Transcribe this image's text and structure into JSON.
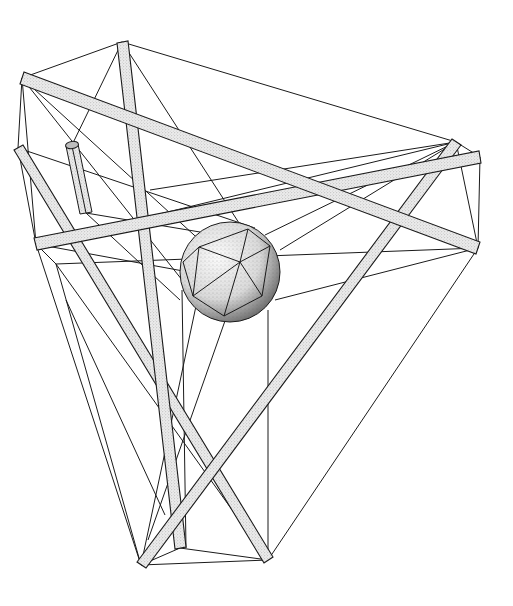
{
  "figure": {
    "title": "Tensegrity structure with suspended sphere",
    "colors": {
      "background": "#ffffff",
      "line": "#1a1a1a",
      "stipple_fill": "#d8d8d8"
    },
    "nodes": {
      "A": [
        122,
        42
      ],
      "B": [
        22,
        78
      ],
      "C": [
        18,
        148
      ],
      "D": [
        36,
        244
      ],
      "E": [
        456,
        142
      ],
      "F": [
        480,
        157
      ],
      "G": [
        478,
        248
      ],
      "H": [
        141,
        565
      ],
      "I": [
        180,
        548
      ],
      "J": [
        268,
        560
      ]
    },
    "struts": [
      {
        "name": "strut-a-i",
        "from": [
          122,
          42
        ],
        "to": [
          180,
          548
        ],
        "width": 11
      },
      {
        "name": "strut-b-g",
        "from": [
          22,
          78
        ],
        "to": [
          478,
          248
        ],
        "width": 11
      },
      {
        "name": "strut-c-j",
        "from": [
          18,
          148
        ],
        "to": [
          268,
          560
        ],
        "width": 11
      },
      {
        "name": "strut-d-f",
        "from": [
          36,
          244
        ],
        "to": [
          480,
          157
        ],
        "width": 11
      },
      {
        "name": "strut-e-h",
        "from": [
          456,
          142
        ],
        "to": [
          141,
          565
        ],
        "width": 11
      }
    ],
    "sphere": {
      "cx": 230,
      "cy": 272,
      "r": 50
    },
    "cylinder": {
      "top": [
        72,
        145
      ],
      "bottom": [
        86,
        213
      ],
      "radius": 6
    }
  }
}
